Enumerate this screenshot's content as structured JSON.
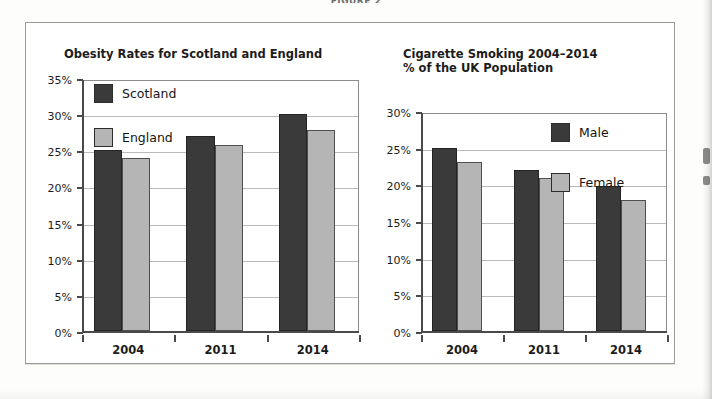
{
  "figure_caption": "FIGURE 2",
  "charts": [
    {
      "id": "obesity",
      "title": "Obesity Rates for Scotland and England",
      "axis": {
        "yticks": [
          "0%",
          "5%",
          "10%",
          "15%",
          "20%",
          "25%",
          "30%",
          "35%"
        ],
        "xticks": [
          "2004",
          "2011",
          "2014"
        ]
      },
      "legend": [
        {
          "label": "Scotland",
          "color": "#3a3a3a"
        },
        {
          "label": "England",
          "color": "#b5b5b5"
        }
      ],
      "chart_data": {
        "type": "bar",
        "title": "Obesity Rates for Scotland and England",
        "categories": [
          "2004",
          "2011",
          "2014"
        ],
        "series": [
          {
            "name": "Scotland",
            "values": [
              25,
              27,
              30
            ],
            "color": "#3a3a3a"
          },
          {
            "name": "England",
            "values": [
              24,
              25.8,
              27.8
            ],
            "color": "#b5b5b5"
          }
        ],
        "xlabel": "",
        "ylabel": "",
        "ylim": [
          0,
          35
        ],
        "ytick_step": 5,
        "ytick_format": "percent",
        "grid": true,
        "legend_position": "inside-top-left"
      }
    },
    {
      "id": "smoking",
      "title": "Cigarette Smoking 2004–2014\n% of the UK Population",
      "axis": {
        "yticks": [
          "0%",
          "5%",
          "10%",
          "15%",
          "20%",
          "25%",
          "30%"
        ],
        "xticks": [
          "2004",
          "2011",
          "2014"
        ]
      },
      "legend": [
        {
          "label": "Male",
          "color": "#3a3a3a"
        },
        {
          "label": "Female",
          "color": "#b5b5b5"
        }
      ],
      "chart_data": {
        "type": "bar",
        "title": "Cigarette Smoking 2004–2014 % of the UK Population",
        "categories": [
          "2004",
          "2011",
          "2014"
        ],
        "series": [
          {
            "name": "Male",
            "values": [
              25,
              22,
              19.8
            ],
            "color": "#3a3a3a"
          },
          {
            "name": "Female",
            "values": [
              23,
              20.8,
              17.8
            ],
            "color": "#b5b5b5"
          }
        ],
        "xlabel": "",
        "ylabel": "",
        "ylim": [
          0,
          30
        ],
        "ytick_step": 5,
        "ytick_format": "percent",
        "grid": true,
        "legend_position": "inside-top-right"
      }
    }
  ]
}
